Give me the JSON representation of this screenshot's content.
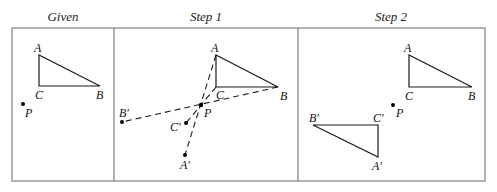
{
  "panels": [
    {
      "title": "Given",
      "labels": {
        "A": "A",
        "B": "B",
        "C": "C",
        "P": "P"
      }
    },
    {
      "title": "Step 1",
      "labels": {
        "A": "A",
        "B": "B",
        "C": "C",
        "P": "P",
        "A_prime": "A′",
        "B_prime": "B′",
        "C_prime": "C′"
      }
    },
    {
      "title": "Step 2",
      "labels": {
        "A": "A",
        "B": "B",
        "C": "C",
        "P": "P",
        "A_prime": "A′",
        "B_prime": "B′",
        "C_prime": "C′"
      }
    }
  ],
  "colors": {
    "frame": "#8a8a8a",
    "lines": "#1a1a1a",
    "background": "#ffffff"
  }
}
